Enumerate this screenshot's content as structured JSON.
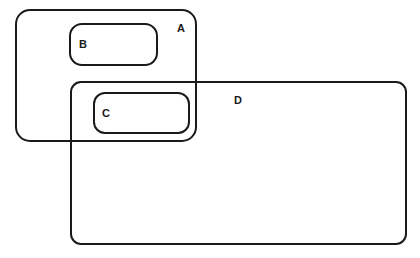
{
  "diagram": {
    "type": "nested-regions",
    "regions": [
      {
        "id": "A",
        "label": "A",
        "x": 16,
        "y": 10,
        "w": 180,
        "h": 131,
        "r": 14,
        "label_x": 177,
        "label_y": 32
      },
      {
        "id": "B",
        "label": "B",
        "x": 70,
        "y": 24,
        "w": 87,
        "h": 41,
        "r": 12,
        "label_x": 79,
        "label_y": 48
      },
      {
        "id": "D",
        "label": "D",
        "x": 71,
        "y": 82,
        "w": 335,
        "h": 162,
        "r": 10,
        "label_x": 234,
        "label_y": 104
      },
      {
        "id": "C",
        "label": "C",
        "x": 94,
        "y": 93,
        "w": 95,
        "h": 40,
        "r": 11,
        "label_x": 102,
        "label_y": 117
      }
    ],
    "relations": [
      "B inside A",
      "C inside A and D",
      "A overlaps D"
    ]
  }
}
